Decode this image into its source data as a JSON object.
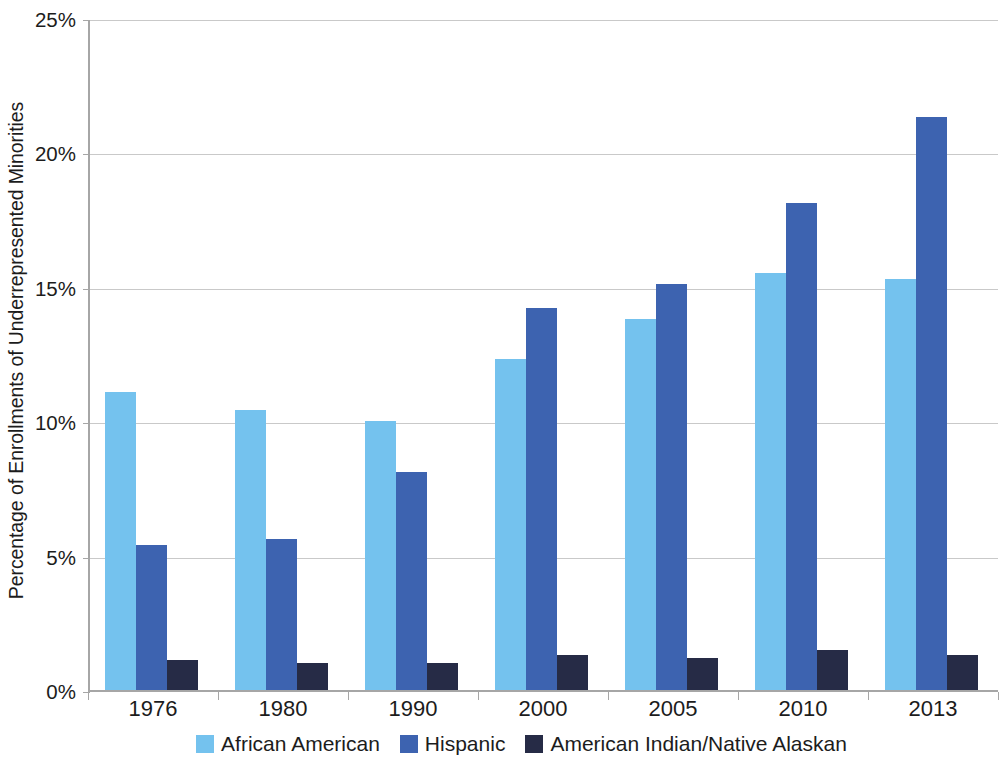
{
  "chart_data": {
    "type": "bar",
    "title": "",
    "subtitle": "",
    "xlabel": "",
    "ylabel": "Percentage of Enrollments of Underrepresented Minorities",
    "categories": [
      "1976",
      "1980",
      "1990",
      "2000",
      "2005",
      "2010",
      "2013"
    ],
    "series": [
      {
        "name": "African American",
        "color": "#74c2ee",
        "values": [
          11.1,
          10.4,
          10.0,
          12.3,
          13.8,
          15.5,
          15.3
        ]
      },
      {
        "name": "Hispanic",
        "color": "#3d63b0",
        "values": [
          5.4,
          5.6,
          8.1,
          14.2,
          15.1,
          18.1,
          21.3
        ]
      },
      {
        "name": "American Indian/Native Alaskan",
        "color": "#262b46",
        "values": [
          1.1,
          1.0,
          1.0,
          1.3,
          1.2,
          1.5,
          1.3
        ]
      }
    ],
    "ylim": [
      0,
      25
    ],
    "ytick_values": [
      0,
      5,
      10,
      15,
      20,
      25
    ],
    "ytick_labels": [
      "0%",
      "5%",
      "10%",
      "15%",
      "20%",
      "25%"
    ],
    "grid": true,
    "grid_axis": "y",
    "legend_position": "bottom",
    "value_suffix": "%"
  },
  "legend": {
    "items": [
      {
        "label": "African American",
        "color": "#74c2ee"
      },
      {
        "label": "Hispanic",
        "color": "#3d63b0"
      },
      {
        "label": "American Indian/Native Alaskan",
        "color": "#262b46"
      }
    ]
  },
  "colors": {
    "african_american": "#74c2ee",
    "hispanic": "#3d63b0",
    "american_indian": "#262b46",
    "gridline": "#c9c9c9",
    "axis": "#a6a6a6",
    "text": "#1c1c1c",
    "background": "#ffffff"
  }
}
